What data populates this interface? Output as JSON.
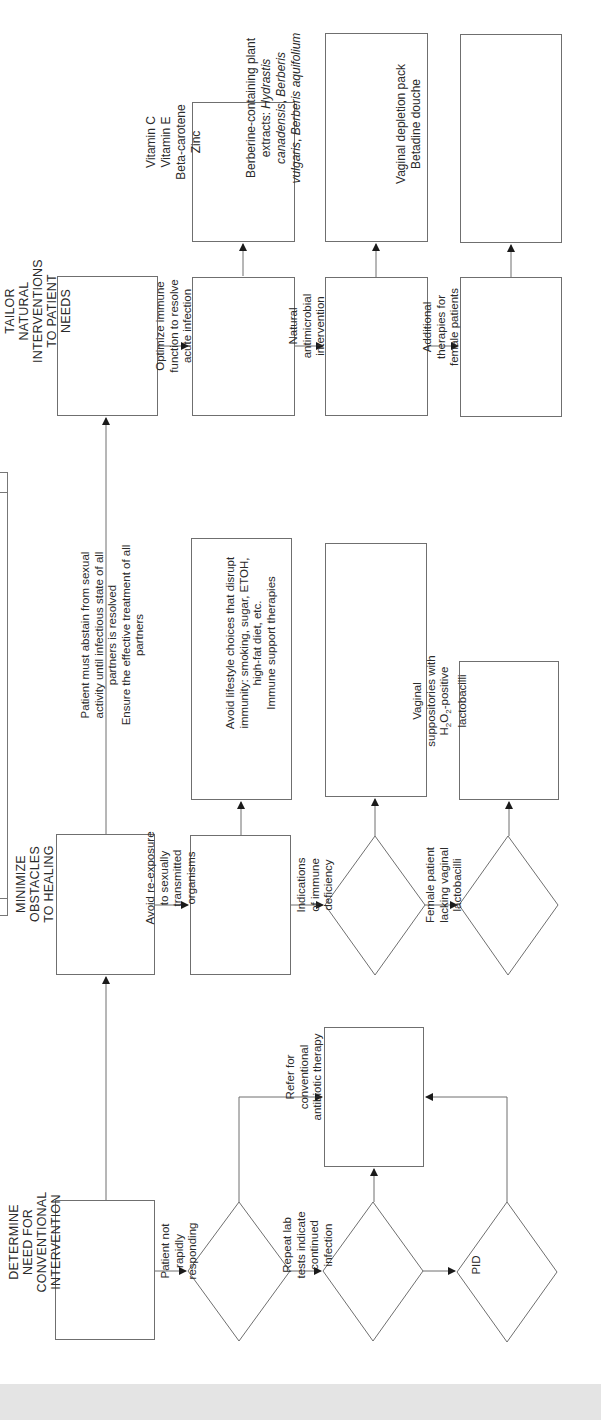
{
  "diagram": {
    "orientation": "rotated-90-ccw",
    "line_color": "#6f6f6f",
    "background": "#ffffff",
    "footer_band_color": "#e4e4e4",
    "headers": {
      "tailor": "TAILOR\nNATURAL\nINTERVENTIONS\nTO PATIENT\nNEEDS",
      "minimize": "MINIMIZE\nOBSTACLES\nTO HEALING",
      "determine": "DETERMINE\nNEED FOR\nCONVENTIONAL\nINTERVENTION"
    },
    "tailor_branch": {
      "immune": "Optimize immune\nfunction to resolve\nacute infection",
      "immune_detail": "Vitamin C\nVitamin E\nBeta-carotene\nZinc",
      "antimicrobial": "Natural\nantimicrobial\nintervention",
      "antimicrobial_detail_1": "Berberine-containing plant\nextracts: ",
      "antimicrobial_detail_species_1": "Hydrastis",
      "antimicrobial_detail_species_2": "canadensis",
      "antimicrobial_detail_species_3": "Berberis",
      "antimicrobial_detail_species_4": "vulgaris",
      "antimicrobial_detail_species_5": "Berberis aquifolium",
      "female": "Additional\ntherapies for\nfemale patients",
      "female_detail": "Vaginal depletion pack\nBetadine douche"
    },
    "minimize_branch": {
      "reexposure": "Avoid re-exposure\nto sexually\ntransmitted\norganisms",
      "reexposure_detail": "Patient must abstain from sexual\nactivity until infectious state of all\npartners is resolved\nEnsure the effective treatment of all\npartners",
      "immune_def": "Indications\nof immune\ndeficiency",
      "immune_def_detail": "Avoid lifestyle choices that disrupt\nimmunity: smoking, sugar, ETOH,\nhigh-fat diet, etc.\nImmune support therapies",
      "lacto": "Female patient\nlacking vaginal\nlactobacilli",
      "lacto_detail_1": "Vaginal\nsuppositories with",
      "lacto_detail_h": "H",
      "lacto_detail_sub2a": "2",
      "lacto_detail_o": "O",
      "lacto_detail_sub2b": "2",
      "lacto_detail_2": "-positive",
      "lacto_detail_3": "lactobacilli"
    },
    "determine_branch": {
      "not_responding": "Patient not\nrapidly\nresponding",
      "repeat_lab": "Repeat lab\ntests indicate\ncontinued\ninfection",
      "pid": "PID",
      "refer": "Refer for\nconventional\nantibiotic therapy"
    }
  }
}
